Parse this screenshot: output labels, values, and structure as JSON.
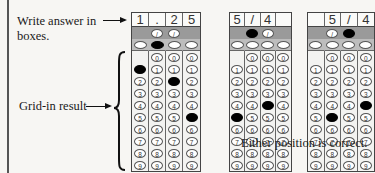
{
  "labels": {
    "write_answer": "Write answer in",
    "boxes": "boxes.",
    "grid_in_result": "Grid-in result",
    "either_position": "Either position is correct."
  },
  "grids": [
    {
      "name": "main-grid",
      "header": [
        "1",
        ".",
        "2",
        "5"
      ],
      "slash_row": [
        false,
        true,
        true,
        false
      ],
      "slash_filled": [
        false,
        false,
        false,
        false
      ],
      "decimal_filled": [
        false,
        true,
        false,
        false
      ],
      "digits_start": [
        1,
        0,
        0,
        0
      ],
      "filled_digit": [
        1,
        null,
        2,
        5
      ]
    },
    {
      "name": "example-grid-left",
      "header": [
        "5",
        "/",
        "4",
        ""
      ],
      "slash_row": [
        false,
        true,
        true,
        false
      ],
      "slash_filled": [
        false,
        true,
        false,
        false
      ],
      "decimal_filled": [
        false,
        false,
        false,
        false
      ],
      "digits_start": [
        1,
        0,
        0,
        0
      ],
      "filled_digit": [
        5,
        null,
        4,
        null
      ]
    },
    {
      "name": "example-grid-right",
      "header": [
        "",
        "5",
        "/",
        "4"
      ],
      "slash_row": [
        false,
        true,
        true,
        false
      ],
      "slash_filled": [
        false,
        false,
        true,
        false
      ],
      "decimal_filled": [
        false,
        false,
        false,
        false
      ],
      "digits_start": [
        1,
        0,
        0,
        0
      ],
      "filled_digit": [
        null,
        5,
        null,
        4
      ]
    }
  ],
  "digits": [
    "0",
    "1",
    "2",
    "3",
    "4",
    "5",
    "6",
    "7",
    "8",
    "9"
  ],
  "slash_symbol": "/"
}
